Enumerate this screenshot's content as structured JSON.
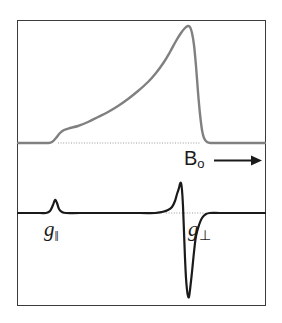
{
  "figure": {
    "background_color": "#ffffff",
    "frame": {
      "x": 17,
      "y": 20,
      "width": 249,
      "height": 286,
      "border_color": "#3b3b3b",
      "border_width": 1.5
    }
  },
  "labels": {
    "field_axis": {
      "base": "B",
      "subscript": "o"
    },
    "g_parallel": {
      "base": "g",
      "subscript": "‖"
    },
    "g_perpendicular": {
      "base": "g",
      "subscript": "⊥"
    }
  },
  "colors": {
    "absorption_curve": "#808080",
    "derivative_curve": "#1a1a1a",
    "baseline_dotted": "#9a9a9a",
    "frame": "#3b3b3b",
    "arrow": "#1a1a1a",
    "text": "#1a1a1a"
  },
  "arrow": {
    "name": "field-direction-arrow",
    "x1": 216,
    "y1": 160,
    "x2": 254,
    "y2": 160,
    "head_size": 6
  },
  "chart_data": {
    "type": "line",
    "xlabel": "Bₒ",
    "ylabel": "",
    "grid": false,
    "legend": null,
    "axis_ranges": {
      "x": [
        17,
        266
      ],
      "y_top_panel": [
        20,
        148
      ],
      "y_bottom_panel": [
        150,
        306
      ]
    },
    "annotations": [
      {
        "text": "Bₒ",
        "x": 184,
        "y": 148,
        "note": "magnetic field axis label with arrow"
      },
      {
        "text": "g‖",
        "x": 44,
        "y": 219,
        "note": "parallel g-value feature, small bump"
      },
      {
        "text": "g⊥",
        "x": 188,
        "y": 219,
        "note": "perpendicular g-value feature, sharp spike"
      }
    ],
    "series": [
      {
        "name": "absorption",
        "panel": "top",
        "color": "#808080",
        "baseline_y": 143,
        "description": "Axial powder absorption envelope: flat baseline, small step (shoulder) at g-parallel, slow rise to a sharp maximum at g-perpendicular, then abrupt fall back to baseline.",
        "points": [
          [
            18,
            143
          ],
          [
            30,
            143
          ],
          [
            40,
            143
          ],
          [
            48,
            143
          ],
          [
            52,
            142
          ],
          [
            56,
            138
          ],
          [
            60,
            133
          ],
          [
            64,
            130
          ],
          [
            70,
            128
          ],
          [
            78,
            126
          ],
          [
            88,
            122
          ],
          [
            98,
            117
          ],
          [
            108,
            112
          ],
          [
            118,
            106
          ],
          [
            128,
            99
          ],
          [
            138,
            91
          ],
          [
            148,
            82
          ],
          [
            156,
            73
          ],
          [
            164,
            62
          ],
          [
            170,
            52
          ],
          [
            176,
            41
          ],
          [
            181,
            33
          ],
          [
            185,
            28
          ],
          [
            188,
            26
          ],
          [
            190,
            27
          ],
          [
            192,
            33
          ],
          [
            194,
            45
          ],
          [
            196,
            66
          ],
          [
            198,
            92
          ],
          [
            200,
            114
          ],
          [
            202,
            130
          ],
          [
            204,
            138
          ],
          [
            207,
            142
          ],
          [
            211,
            143
          ],
          [
            220,
            143
          ],
          [
            240,
            143
          ],
          [
            265,
            143
          ]
        ],
        "baseline_dots": {
          "from_x": 58,
          "to_x": 200,
          "y": 143
        }
      },
      {
        "name": "first-derivative",
        "panel": "bottom",
        "color": "#1a1a1a",
        "baseline_y": 213,
        "description": "First derivative of the absorption: flat baseline, a small positive bump at g-parallel, then a very large sharp positive spike immediately followed by a deep negative excursion at g-perpendicular, returning to baseline.",
        "points": [
          [
            18,
            213
          ],
          [
            30,
            213
          ],
          [
            40,
            213
          ],
          [
            46,
            213
          ],
          [
            50,
            211
          ],
          [
            53,
            205
          ],
          [
            55,
            200
          ],
          [
            57,
            203
          ],
          [
            59,
            209
          ],
          [
            62,
            212
          ],
          [
            66,
            213
          ],
          [
            80,
            213
          ],
          [
            110,
            213
          ],
          [
            140,
            213
          ],
          [
            155,
            213
          ],
          [
            162,
            212
          ],
          [
            168,
            210
          ],
          [
            172,
            207
          ],
          [
            175,
            201
          ],
          [
            177,
            194
          ],
          [
            179,
            188
          ],
          [
            180,
            184
          ],
          [
            181,
            183
          ],
          [
            182,
            190
          ],
          [
            183,
            206
          ],
          [
            184,
            232
          ],
          [
            185,
            258
          ],
          [
            186,
            278
          ],
          [
            187,
            290
          ],
          [
            188,
            296
          ],
          [
            189,
            297
          ],
          [
            190,
            290
          ],
          [
            192,
            272
          ],
          [
            194,
            252
          ],
          [
            196,
            236
          ],
          [
            199,
            225
          ],
          [
            202,
            218
          ],
          [
            206,
            214
          ],
          [
            210,
            213
          ],
          [
            220,
            213
          ],
          [
            240,
            213
          ],
          [
            265,
            213
          ]
        ],
        "baseline_dots": {
          "from_x": 166,
          "to_x": 205,
          "y": 213
        },
        "peak_top_y": 183,
        "trough_bottom_y": 297,
        "spike_x": 182
      }
    ]
  }
}
